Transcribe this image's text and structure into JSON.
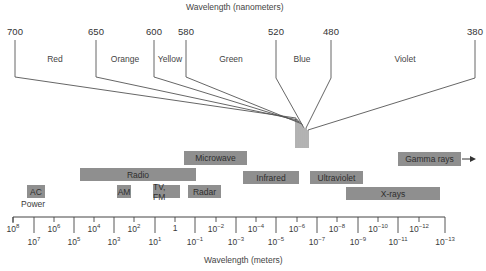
{
  "chart_data": {
    "type": "diagram",
    "top_axis": {
      "label": "Wavelength (nanometers)",
      "ticks": [
        {
          "value": "700",
          "x": 15
        },
        {
          "value": "650",
          "x": 96
        },
        {
          "value": "600",
          "x": 154
        },
        {
          "value": "580",
          "x": 186
        },
        {
          "value": "520",
          "x": 276
        },
        {
          "value": "480",
          "x": 331
        },
        {
          "value": "380",
          "x": 475
        }
      ],
      "colors": [
        {
          "name": "Red",
          "x": 55
        },
        {
          "name": "Orange",
          "x": 125
        },
        {
          "name": "Yellow",
          "x": 170
        },
        {
          "name": "Green",
          "x": 231
        },
        {
          "name": "Blue",
          "x": 302
        },
        {
          "name": "Violet",
          "x": 405
        }
      ]
    },
    "bands": [
      {
        "name": "Microwave",
        "label": "Microwave",
        "x": 184,
        "y": 151,
        "w": 63,
        "h": 14
      },
      {
        "name": "Radio",
        "label": "Radio",
        "x": 80,
        "y": 168,
        "w": 116,
        "h": 13
      },
      {
        "name": "Infrared",
        "label": "Infrared",
        "x": 243,
        "y": 171,
        "w": 56,
        "h": 13
      },
      {
        "name": "Ultraviolet",
        "label": "Ultraviolet",
        "x": 310,
        "y": 171,
        "w": 53,
        "h": 13
      },
      {
        "name": "Gamma rays",
        "label": "Gamma rays",
        "x": 398,
        "y": 152,
        "w": 63,
        "h": 14
      },
      {
        "name": "AC",
        "label": "AC",
        "x": 27,
        "y": 185,
        "w": 18,
        "h": 13
      },
      {
        "name": "AM",
        "label": "AM",
        "x": 117,
        "y": 185,
        "w": 14,
        "h": 13
      },
      {
        "name": "TV, FM",
        "label": "TV, FM",
        "x": 153,
        "y": 185,
        "w": 27,
        "h": 13
      },
      {
        "name": "Radar",
        "label": "Radar",
        "x": 188,
        "y": 185,
        "w": 33,
        "h": 13
      },
      {
        "name": "X-rays",
        "label": "X-rays",
        "x": 346,
        "y": 187,
        "w": 94,
        "h": 13
      }
    ],
    "gamma_arrow": true,
    "power_label": "Power",
    "bottom_axis": {
      "label": "Wavelength (meters)",
      "range": [
        "10^8",
        "10^-13"
      ],
      "ticks_upper": [
        {
          "base": "10",
          "exp": "8",
          "x": 13
        },
        {
          "base": "10",
          "exp": "6",
          "x": 54
        },
        {
          "base": "10",
          "exp": "4",
          "x": 94
        },
        {
          "base": "10",
          "exp": "2",
          "x": 134
        },
        {
          "base": "1",
          "exp": "",
          "x": 175
        },
        {
          "base": "10",
          "exp": "−2",
          "x": 216
        },
        {
          "base": "10",
          "exp": "−4",
          "x": 256
        },
        {
          "base": "10",
          "exp": "−6",
          "x": 297
        },
        {
          "base": "10",
          "exp": "−8",
          "x": 337
        },
        {
          "base": "10",
          "exp": "−10",
          "x": 378
        },
        {
          "base": "10",
          "exp": "−12",
          "x": 419
        }
      ],
      "ticks_lower": [
        {
          "base": "10",
          "exp": "7",
          "x": 34
        },
        {
          "base": "10",
          "exp": "5",
          "x": 74
        },
        {
          "base": "10",
          "exp": "3",
          "x": 114
        },
        {
          "base": "10",
          "exp": "1",
          "x": 155
        },
        {
          "base": "10",
          "exp": "−1",
          "x": 195
        },
        {
          "base": "10",
          "exp": "−3",
          "x": 236
        },
        {
          "base": "10",
          "exp": "−5",
          "x": 276
        },
        {
          "base": "10",
          "exp": "−7",
          "x": 317
        },
        {
          "base": "10",
          "exp": "−9",
          "x": 358
        },
        {
          "base": "10",
          "exp": "−11",
          "x": 398
        },
        {
          "base": "10",
          "exp": "−13",
          "x": 445
        }
      ]
    }
  },
  "colors": {
    "band_fill": "#8f8f8f",
    "line": "#555555",
    "text": "#3a3a3a"
  }
}
